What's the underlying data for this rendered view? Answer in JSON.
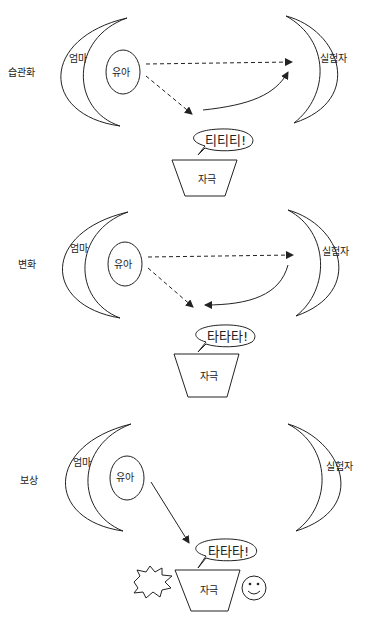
{
  "panels": [
    {
      "title": "습관화",
      "mother": "엄마",
      "infant": "유아",
      "experimenter": "실험자",
      "stimulus": "자극",
      "speech": "티티티!"
    },
    {
      "title": "변화",
      "mother": "엄마",
      "infant": "유아",
      "experimenter": "실험자",
      "stimulus": "자극",
      "speech": "타타타!"
    },
    {
      "title": "보상",
      "mother": "엄마",
      "infant": "유아",
      "experimenter": "실험자",
      "stimulus": "자극",
      "speech": "타타타!"
    }
  ]
}
